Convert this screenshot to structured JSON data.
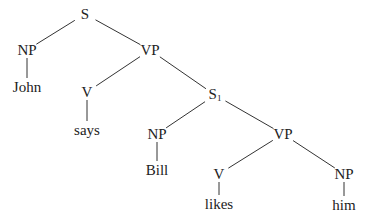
{
  "diagram": {
    "type": "syntax-tree",
    "line_color": "#333333",
    "text_color": "#222222",
    "nodes": [
      {
        "id": "S",
        "label": "S",
        "sub": "",
        "x": 85,
        "y": 14
      },
      {
        "id": "NP1",
        "label": "NP",
        "sub": "",
        "x": 27,
        "y": 50
      },
      {
        "id": "John",
        "label": "John",
        "sub": "",
        "x": 27,
        "y": 87
      },
      {
        "id": "VP1",
        "label": "VP",
        "sub": "",
        "x": 150,
        "y": 50
      },
      {
        "id": "V1",
        "label": "V",
        "sub": "",
        "x": 87,
        "y": 92
      },
      {
        "id": "says",
        "label": "says",
        "sub": "",
        "x": 87,
        "y": 130
      },
      {
        "id": "S1",
        "label": "S",
        "sub": "1",
        "x": 215,
        "y": 95
      },
      {
        "id": "NP2",
        "label": "NP",
        "sub": "",
        "x": 157,
        "y": 134
      },
      {
        "id": "Bill",
        "label": "Bill",
        "sub": "",
        "x": 157,
        "y": 170
      },
      {
        "id": "VP2",
        "label": "VP",
        "sub": "",
        "x": 283,
        "y": 134
      },
      {
        "id": "V2",
        "label": "V",
        "sub": "",
        "x": 219,
        "y": 174
      },
      {
        "id": "likes",
        "label": "likes",
        "sub": "",
        "x": 219,
        "y": 204
      },
      {
        "id": "NP3",
        "label": "NP",
        "sub": "",
        "x": 344,
        "y": 174
      },
      {
        "id": "him",
        "label": "him",
        "sub": "",
        "x": 344,
        "y": 205
      }
    ],
    "edges": [
      [
        "S",
        "NP1"
      ],
      [
        "S",
        "VP1"
      ],
      [
        "NP1",
        "John"
      ],
      [
        "VP1",
        "V1"
      ],
      [
        "VP1",
        "S1"
      ],
      [
        "V1",
        "says"
      ],
      [
        "S1",
        "NP2"
      ],
      [
        "S1",
        "VP2"
      ],
      [
        "NP2",
        "Bill"
      ],
      [
        "VP2",
        "V2"
      ],
      [
        "VP2",
        "NP3"
      ],
      [
        "V2",
        "likes"
      ],
      [
        "NP3",
        "him"
      ]
    ]
  }
}
